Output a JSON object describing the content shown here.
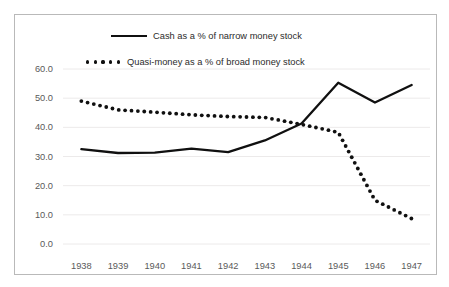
{
  "chart_data": {
    "type": "line",
    "title": "",
    "xlabel": "",
    "ylabel": "",
    "categories": [
      "1938",
      "1939",
      "1940",
      "1941",
      "1942",
      "1943",
      "1944",
      "1945",
      "1946",
      "1947"
    ],
    "x": [
      1938,
      1939,
      1940,
      1941,
      1942,
      1943,
      1944,
      1945,
      1946,
      1947
    ],
    "ylim": [
      0.0,
      60.0
    ],
    "y_ticks": [
      "0.0",
      "10.0",
      "20.0",
      "30.0",
      "40.0",
      "50.0",
      "60.0"
    ],
    "y_tick_values": [
      0.0,
      10.0,
      20.0,
      30.0,
      40.0,
      50.0,
      60.0
    ],
    "grid": "horizontal",
    "legend_position": "top-center",
    "series": [
      {
        "name": "Cash as a % of narrow money stock",
        "style": "solid",
        "color": "#101010",
        "values": [
          32.5,
          31.2,
          31.3,
          32.7,
          31.5,
          35.5,
          41.3,
          55.3,
          48.5,
          54.5
        ]
      },
      {
        "name": "Quasi-money as a % of broad money stock",
        "style": "dotted",
        "color": "#101010",
        "values": [
          49.0,
          46.0,
          45.2,
          44.3,
          43.7,
          43.4,
          41.0,
          38.3,
          15.0,
          8.7
        ]
      }
    ]
  },
  "legend": {
    "cash_label": "Cash as a % of narrow money stock",
    "quasi_label": "Quasi-money as a % of broad money stock"
  },
  "colors": {
    "line": "#101010",
    "grid": "#eceaea",
    "border": "#b9b9b9",
    "tick_text": "#5a5a5a",
    "legend_text": "#2b2b2b"
  }
}
